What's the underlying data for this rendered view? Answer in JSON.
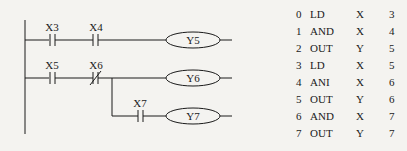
{
  "ladder": {
    "rungs": [
      {
        "contacts": [
          {
            "label": "X3",
            "type": "NO"
          },
          {
            "label": "X4",
            "type": "NO"
          }
        ],
        "coil": "Y5"
      },
      {
        "contacts": [
          {
            "label": "X5",
            "type": "NO"
          },
          {
            "label": "X6",
            "type": "NC"
          }
        ],
        "coil": "Y6"
      },
      {
        "contacts": [
          {
            "label": "X7",
            "type": "NO"
          }
        ],
        "coil": "Y7",
        "branch_from": "X6"
      }
    ]
  },
  "instruction_list": [
    {
      "step": "0",
      "op": "LD",
      "device": "X",
      "num": "3"
    },
    {
      "step": "1",
      "op": "AND",
      "device": "X",
      "num": "4"
    },
    {
      "step": "2",
      "op": "OUT",
      "device": "Y",
      "num": "5"
    },
    {
      "step": "3",
      "op": "LD",
      "device": "X",
      "num": "5"
    },
    {
      "step": "4",
      "op": "ANI",
      "device": "X",
      "num": "6"
    },
    {
      "step": "5",
      "op": "OUT",
      "device": "Y",
      "num": "6"
    },
    {
      "step": "6",
      "op": "AND",
      "device": "X",
      "num": "7"
    },
    {
      "step": "7",
      "op": "OUT",
      "device": "Y",
      "num": "7"
    }
  ]
}
